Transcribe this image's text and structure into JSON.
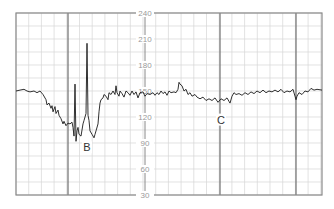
{
  "chart_data": {
    "type": "line",
    "title": "",
    "xlabel": "",
    "ylabel": "",
    "ylim": [
      30,
      240
    ],
    "y_ticks": [
      240,
      210,
      180,
      150,
      120,
      90,
      60,
      30
    ],
    "grid": true,
    "minor_grid_step_bpm": 15,
    "legend": null,
    "annotations": [
      {
        "label": "B",
        "x": 87,
        "bpm": 85
      },
      {
        "label": "C",
        "x": 221,
        "bpm": 117
      }
    ],
    "series": [
      {
        "name": "fetal heart rate",
        "points": [
          [
            16,
            150
          ],
          [
            20,
            151
          ],
          [
            24,
            152
          ],
          [
            27,
            150
          ],
          [
            30,
            149
          ],
          [
            34,
            150
          ],
          [
            37,
            148
          ],
          [
            40,
            150
          ],
          [
            43,
            146
          ],
          [
            46,
            140
          ],
          [
            47,
            134
          ],
          [
            49,
            136
          ],
          [
            51,
            130
          ],
          [
            52,
            133
          ],
          [
            53,
            126
          ],
          [
            55,
            132
          ],
          [
            56,
            124
          ],
          [
            58,
            128
          ],
          [
            59,
            122
          ],
          [
            61,
            118
          ],
          [
            63,
            112
          ],
          [
            64,
            115
          ],
          [
            66,
            110
          ],
          [
            68,
            113
          ],
          [
            70,
            112
          ],
          [
            72,
            114
          ],
          [
            73,
            108
          ],
          [
            74,
            98
          ],
          [
            75,
            158
          ],
          [
            76,
            92
          ],
          [
            77,
            104
          ],
          [
            78,
            108
          ],
          [
            79,
            100
          ],
          [
            81,
            98
          ],
          [
            83,
            112
          ],
          [
            84,
            116
          ],
          [
            86,
            124
          ],
          [
            87,
            205
          ],
          [
            88,
            122
          ],
          [
            89,
            116
          ],
          [
            90,
            104
          ],
          [
            92,
            100
          ],
          [
            94,
            96
          ],
          [
            95,
            100
          ],
          [
            96,
            104
          ],
          [
            98,
            112
          ],
          [
            99,
            126
          ],
          [
            100,
            136
          ],
          [
            101,
            140
          ],
          [
            103,
            142
          ],
          [
            104,
            146
          ],
          [
            106,
            144
          ],
          [
            108,
            140
          ],
          [
            109,
            148
          ],
          [
            111,
            146
          ],
          [
            113,
            150
          ],
          [
            115,
            146
          ],
          [
            116,
            156
          ],
          [
            117,
            148
          ],
          [
            119,
            144
          ],
          [
            120,
            150
          ],
          [
            122,
            147
          ],
          [
            124,
            143
          ],
          [
            126,
            150
          ],
          [
            128,
            148
          ],
          [
            130,
            145
          ],
          [
            132,
            150
          ],
          [
            134,
            146
          ],
          [
            136,
            149
          ],
          [
            138,
            142
          ],
          [
            140,
            148
          ],
          [
            143,
            149
          ],
          [
            145,
            144
          ],
          [
            147,
            147
          ],
          [
            150,
            146
          ],
          [
            153,
            148
          ],
          [
            155,
            145
          ],
          [
            157,
            148
          ],
          [
            159,
            146
          ],
          [
            161,
            150
          ],
          [
            163,
            147
          ],
          [
            165,
            149
          ],
          [
            167,
            145
          ],
          [
            169,
            150
          ],
          [
            171,
            148
          ],
          [
            174,
            149
          ],
          [
            176,
            148
          ],
          [
            178,
            152
          ],
          [
            179,
            160
          ],
          [
            180,
            158
          ],
          [
            182,
            156
          ],
          [
            184,
            150
          ],
          [
            186,
            152
          ],
          [
            188,
            146
          ],
          [
            190,
            148
          ],
          [
            192,
            144
          ],
          [
            195,
            146
          ],
          [
            197,
            143
          ],
          [
            200,
            141
          ],
          [
            203,
            143
          ],
          [
            206,
            139
          ],
          [
            209,
            141
          ],
          [
            212,
            139
          ],
          [
            215,
            142
          ],
          [
            218,
            137
          ],
          [
            221,
            141
          ],
          [
            224,
            139
          ],
          [
            227,
            142
          ],
          [
            229,
            138
          ],
          [
            230,
            136
          ],
          [
            232,
            144
          ],
          [
            234,
            148
          ],
          [
            236,
            146
          ],
          [
            239,
            147
          ],
          [
            242,
            145
          ],
          [
            245,
            148
          ],
          [
            248,
            146
          ],
          [
            251,
            149
          ],
          [
            254,
            147
          ],
          [
            257,
            150
          ],
          [
            260,
            148
          ],
          [
            263,
            151
          ],
          [
            266,
            148
          ],
          [
            269,
            150
          ],
          [
            272,
            149
          ],
          [
            275,
            151
          ],
          [
            278,
            149
          ],
          [
            281,
            152
          ],
          [
            284,
            148
          ],
          [
            287,
            150
          ],
          [
            290,
            149
          ],
          [
            293,
            152
          ],
          [
            295,
            144
          ],
          [
            296,
            140
          ],
          [
            297,
            144
          ],
          [
            299,
            148
          ],
          [
            302,
            146
          ],
          [
            305,
            150
          ],
          [
            308,
            149
          ],
          [
            311,
            153
          ],
          [
            314,
            151
          ],
          [
            317,
            152
          ],
          [
            322,
            151
          ]
        ]
      }
    ],
    "layout": {
      "plot_left": 16,
      "plot_right": 322,
      "plot_top": 13,
      "plot_bottom": 195,
      "axis_x": 145,
      "minor_v_step_px": 12.7,
      "major_v_lines_x": [
        68,
        220,
        296
      ],
      "colors": {
        "grid_minor": "#d6d6d6",
        "grid_major": "#707070",
        "frame": "#8a8a8a",
        "trace": "#1a1a1a",
        "tick_text": "#9a9a9a"
      }
    }
  }
}
